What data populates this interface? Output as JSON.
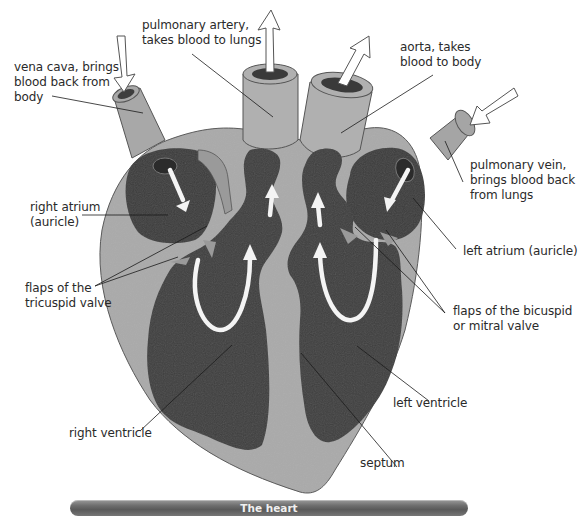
{
  "caption": "The heart",
  "labels": {
    "pulmonary_artery": "pulmonary artery,\ntakes blood to lungs",
    "vena_cava": "vena cava, brings\nblood back from\nbody",
    "aorta": "aorta, takes\nblood to body",
    "pulmonary_vein": "pulmonary vein,\nbrings blood back\nfrom lungs",
    "right_atrium": "right atrium\n(auricle)",
    "left_atrium": "left atrium (auricle)",
    "tricuspid_flaps": "flaps of the\ntricuspid valve",
    "bicuspid_flaps": "flaps of the bicuspid\nor mitral valve",
    "left_ventricle": "left ventricle",
    "right_ventricle": "right ventricle",
    "septum": "septum"
  },
  "colors": {
    "wall": "#a9a9a9",
    "chamber": "#3e3e3e",
    "vessel": "#b0b0b0",
    "arrow": "#f4f4f4",
    "caption_bar": "#6a6a6a"
  }
}
